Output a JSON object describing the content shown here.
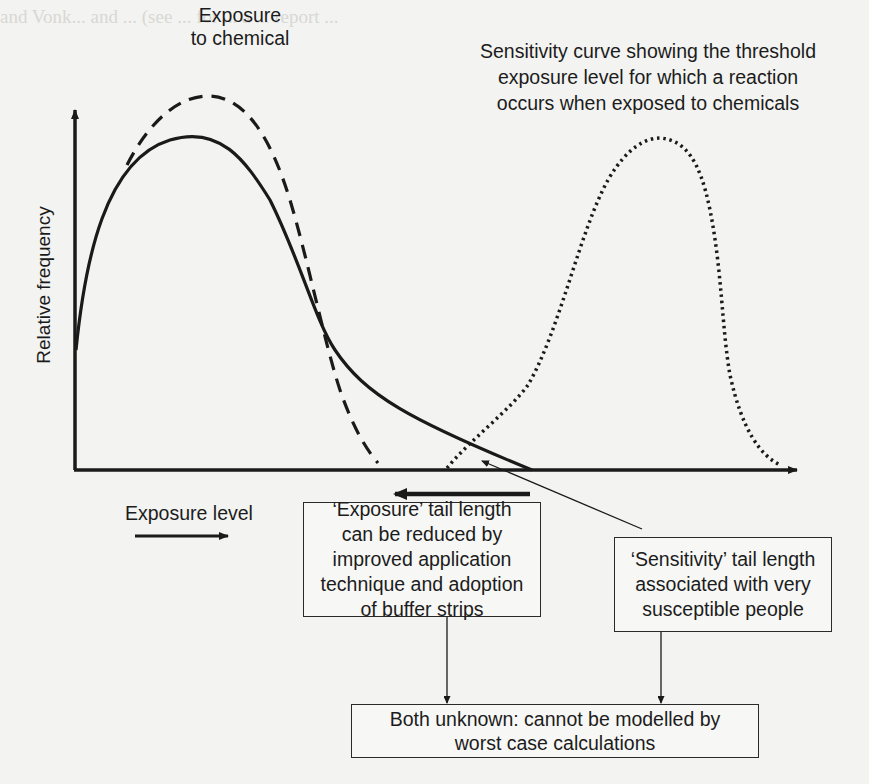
{
  "bleed_through_text": {
    "line1": "and Vonk... and ... (see ... for ... a ... report ...",
    "heading": "Bystander exposure"
  },
  "labels": {
    "exposure_curve": [
      "Exposure",
      "to chemical"
    ],
    "sensitivity_curve": [
      "Sensitivity curve showing the threshold",
      "exposure level for which a reaction",
      "occurs when exposed to chemicals"
    ],
    "y_axis": "Relative frequency",
    "x_axis": "Exposure level"
  },
  "boxes": {
    "exposure_tail": [
      "‘Exposure’ tail length",
      "can be reduced by",
      "improved application",
      "technique and adoption",
      "of buffer strips"
    ],
    "sensitivity_tail": [
      "‘Sensitivity’ tail length",
      "associated with very",
      "susceptible people"
    ],
    "conclusion": [
      "Both unknown: cannot be modelled by",
      "worst case calculations"
    ]
  },
  "curves": {
    "solid": "Actual exposure distribution",
    "dashed": "Exposure to chemical (reduced tail)",
    "dotted": "Sensitivity curve"
  },
  "colors": {
    "ink": "#1a1a1a",
    "paper": "#f3f3f1"
  }
}
